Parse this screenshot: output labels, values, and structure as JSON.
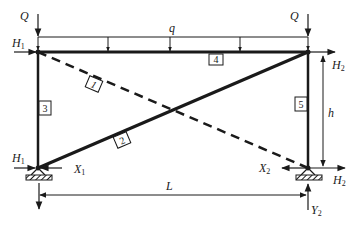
{
  "diagram": {
    "type": "planar truss/frame structural diagram",
    "loads": {
      "Q_left": "Q",
      "Q_right": "Q",
      "distributed": "q"
    },
    "reactions": {
      "H1_top": {
        "base": "H",
        "sub": "1"
      },
      "H1_bottom": {
        "base": "H",
        "sub": "1"
      },
      "X1": {
        "base": "X",
        "sub": "1"
      },
      "H2_top": {
        "base": "H",
        "sub": "2"
      },
      "H2_bottom": {
        "base": "H",
        "sub": "2"
      },
      "X2": {
        "base": "X",
        "sub": "2"
      },
      "Y2": {
        "base": "Y",
        "sub": "2"
      }
    },
    "dimensions": {
      "height": "h",
      "length": "L"
    },
    "members": [
      {
        "id": "1",
        "style": "dashed",
        "from": "top-left",
        "to": "bottom-right"
      },
      {
        "id": "2",
        "style": "solid",
        "from": "bottom-left",
        "to": "top-right"
      },
      {
        "id": "3",
        "style": "solid",
        "from": "top-left",
        "to": "bottom-left"
      },
      {
        "id": "4",
        "style": "solid",
        "from": "top-left",
        "to": "top-right"
      },
      {
        "id": "5",
        "style": "solid",
        "from": "top-right",
        "to": "bottom-right"
      }
    ],
    "colors": {
      "ink": "#1a1a1a",
      "background": "#ffffff"
    }
  }
}
